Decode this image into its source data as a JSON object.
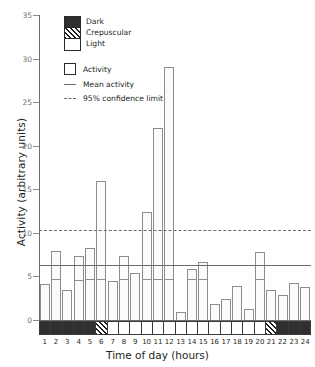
{
  "chart_data": {
    "type": "bar",
    "title": "",
    "xlabel": "Time of day (hours)",
    "ylabel": "Activity (arbitrary units)",
    "categories": [
      "1",
      "2",
      "3",
      "4",
      "5",
      "6",
      "7",
      "8",
      "9",
      "10",
      "11",
      "12",
      "13",
      "14",
      "15",
      "16",
      "17",
      "18",
      "19",
      "20",
      "21",
      "22",
      "23",
      "24"
    ],
    "values": [
      4.1,
      7.9,
      3.5,
      7.4,
      8.3,
      16.0,
      4.5,
      7.4,
      5.4,
      12.4,
      22.0,
      29.0,
      0.9,
      5.8,
      6.7,
      1.8,
      2.4,
      3.9,
      1.3,
      7.8,
      3.4,
      2.9,
      4.3,
      3.8
    ],
    "segment_values": [
      4.1,
      4.6,
      3.5,
      4.5,
      4.6,
      4.6,
      4.5,
      4.6,
      5.4,
      4.6,
      4.6,
      4.6,
      0.9,
      4.6,
      4.6,
      1.8,
      2.4,
      3.9,
      1.3,
      4.6,
      3.4,
      2.9,
      4.3,
      3.8
    ],
    "ylim": [
      0,
      35
    ],
    "yticks": [
      0,
      5,
      10,
      15,
      20,
      25,
      30,
      35
    ],
    "ytick_labels": [
      "0",
      "5",
      "10",
      "15",
      "20",
      "25",
      "30",
      "35"
    ],
    "grid": false,
    "mean_activity": 6.3,
    "confidence_limit_95": 10.3,
    "light_cycle": [
      "dark",
      "dark",
      "dark",
      "dark",
      "dark",
      "crepuscular",
      "light",
      "light",
      "light",
      "light",
      "light",
      "light",
      "light",
      "light",
      "light",
      "light",
      "light",
      "light",
      "light",
      "light",
      "crepuscular",
      "dark",
      "dark",
      "dark"
    ],
    "legend": {
      "position": "top-left",
      "cycle_entries": [
        {
          "label": "Dark",
          "swatch": "dark-swatch"
        },
        {
          "label": "Crepuscular",
          "swatch": "crepuscular-swatch"
        },
        {
          "label": "Light",
          "swatch": "light-swatch"
        }
      ],
      "series_entries": [
        {
          "label": "Activity",
          "swatch": "bar-swatch"
        },
        {
          "label": "Mean activity",
          "swatch": "solid-line-swatch"
        },
        {
          "label": "95% confidence limit",
          "swatch": "dashed-line-swatch"
        }
      ]
    }
  }
}
